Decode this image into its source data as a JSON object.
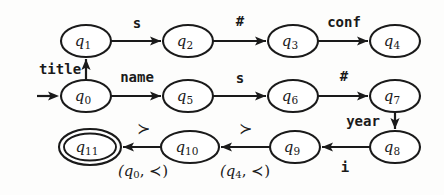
{
  "figure": {
    "kind": "finite-state-automaton-diagram",
    "title": "",
    "ink_color": "#1a1a1a",
    "background_color": "#fdfdfc"
  },
  "states": [
    {
      "id": "q0",
      "label_base": "q",
      "label_sub": "0",
      "cx": 86,
      "cy": 96,
      "rx": 25,
      "ry": 16,
      "accepting": false
    },
    {
      "id": "q1",
      "label_base": "q",
      "label_sub": "1",
      "cx": 86,
      "cy": 41,
      "rx": 25,
      "ry": 16,
      "accepting": false
    },
    {
      "id": "q2",
      "label_base": "q",
      "label_sub": "2",
      "cx": 188,
      "cy": 41,
      "rx": 25,
      "ry": 16,
      "accepting": false
    },
    {
      "id": "q3",
      "label_base": "q",
      "label_sub": "3",
      "cx": 293,
      "cy": 41,
      "rx": 25,
      "ry": 16,
      "accepting": false
    },
    {
      "id": "q4",
      "label_base": "q",
      "label_sub": "4",
      "cx": 395,
      "cy": 41,
      "rx": 25,
      "ry": 16,
      "accepting": false
    },
    {
      "id": "q5",
      "label_base": "q",
      "label_sub": "5",
      "cx": 188,
      "cy": 96,
      "rx": 25,
      "ry": 16,
      "accepting": false
    },
    {
      "id": "q6",
      "label_base": "q",
      "label_sub": "6",
      "cx": 293,
      "cy": 96,
      "rx": 25,
      "ry": 16,
      "accepting": false
    },
    {
      "id": "q7",
      "label_base": "q",
      "label_sub": "7",
      "cx": 395,
      "cy": 96,
      "rx": 25,
      "ry": 16,
      "accepting": false
    },
    {
      "id": "q8",
      "label_base": "q",
      "label_sub": "8",
      "cx": 395,
      "cy": 147,
      "rx": 25,
      "ry": 16,
      "accepting": false
    },
    {
      "id": "q9",
      "label_base": "q",
      "label_sub": "9",
      "cx": 295,
      "cy": 147,
      "rx": 25,
      "ry": 16,
      "accepting": false
    },
    {
      "id": "q10",
      "label_base": "q",
      "label_sub": "10",
      "cx": 190,
      "cy": 147,
      "rx": 29,
      "ry": 16,
      "accepting": false
    },
    {
      "id": "q11",
      "label_base": "q",
      "label_sub": "11",
      "cx": 90,
      "cy": 147,
      "rx": 31,
      "ry": 18,
      "accepting": true
    }
  ],
  "start_arrow": {
    "from_x": 37,
    "to_x": 59,
    "y": 96,
    "target": "q0"
  },
  "transitions": [
    {
      "from": "q0",
      "to": "q1",
      "label": "title",
      "label_style": "mono",
      "label_x": 60,
      "label_y": 70,
      "direction": "up"
    },
    {
      "from": "q1",
      "to": "q2",
      "label": "s",
      "label_style": "mono",
      "label_x": 137,
      "label_y": 24,
      "direction": "right"
    },
    {
      "from": "q2",
      "to": "q3",
      "label": "#",
      "label_style": "mono",
      "label_x": 240,
      "label_y": 22,
      "direction": "right"
    },
    {
      "from": "q3",
      "to": "q4",
      "label": "conf",
      "label_style": "mono",
      "label_x": 344,
      "label_y": 23,
      "direction": "right"
    },
    {
      "from": "q0",
      "to": "q5",
      "label": "name",
      "label_style": "mono",
      "label_x": 137,
      "label_y": 78,
      "direction": "right"
    },
    {
      "from": "q5",
      "to": "q6",
      "label": "s",
      "label_style": "mono",
      "label_x": 240,
      "label_y": 79,
      "direction": "right"
    },
    {
      "from": "q6",
      "to": "q7",
      "label": "#",
      "label_style": "mono",
      "label_x": 344,
      "label_y": 77,
      "direction": "right"
    },
    {
      "from": "q7",
      "to": "q8",
      "label": "year",
      "label_style": "mono",
      "label_x": 363,
      "label_y": 122,
      "direction": "down"
    },
    {
      "from": "q8",
      "to": "q9",
      "label": "i",
      "label_style": "mono",
      "label_x": 345,
      "label_y": 168,
      "direction": "left"
    },
    {
      "from": "q9",
      "to": "q10",
      "label": "≻",
      "label_style": "symbol",
      "label_x": 245,
      "label_y": 129,
      "direction": "left",
      "sublabel": {
        "base_left": "(q",
        "sub": "4",
        "rel": ", ≺)",
        "x": 245,
        "y": 172
      }
    },
    {
      "from": "q10",
      "to": "q11",
      "label": "≻",
      "label_style": "symbol",
      "label_x": 143,
      "label_y": 129,
      "direction": "left",
      "sublabel": {
        "base_left": "(q",
        "sub": "0",
        "rel": ", ≺)",
        "x": 143,
        "y": 172
      }
    }
  ],
  "alphabet_labels": [
    "title",
    "name",
    "s",
    "#",
    "conf",
    "year",
    "i",
    "≻",
    "≺"
  ],
  "accepting_states": [
    "q11"
  ],
  "initial_state": "q0"
}
